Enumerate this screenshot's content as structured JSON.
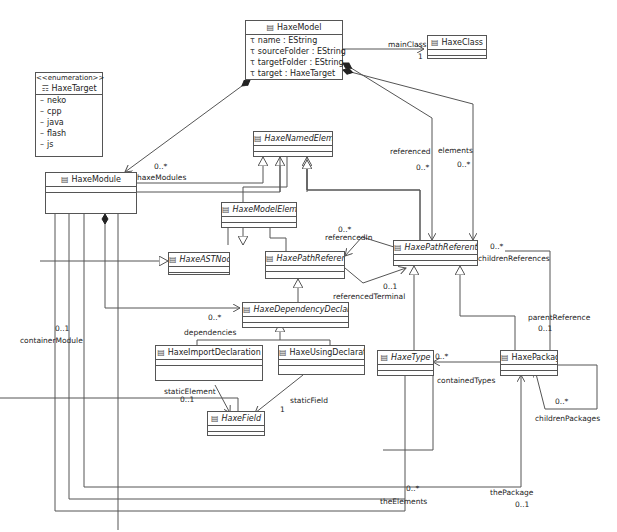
{
  "diagram": {
    "type": "UML class diagram (Ecore)",
    "classes": {
      "haxeModel": {
        "name": "HaxeModel",
        "abstract": false,
        "attributes": [
          "name : EString",
          "sourceFolder : EString",
          "targetFolder : EString",
          "target : HaxeTarget"
        ]
      },
      "haxeClass": {
        "name": "HaxeClass",
        "abstract": false
      },
      "haxeTarget": {
        "stereotype": "<<enumeration>>",
        "name": "HaxeTarget",
        "literals": [
          "neko",
          "cpp",
          "java",
          "flash",
          "js"
        ]
      },
      "haxeModule": {
        "name": "HaxeModule",
        "abstract": false
      },
      "haxeNamedElement": {
        "name": "HaxeNamedElement",
        "abstract": true
      },
      "haxeModelElement": {
        "name": "HaxeModelElement",
        "abstract": true
      },
      "haxeASTNode": {
        "name": "HaxeASTNode",
        "abstract": true
      },
      "haxePathReference": {
        "name": "HaxePathReference",
        "abstract": true
      },
      "haxePathReferentiable": {
        "name": "HaxePathReferentiable",
        "abstract": true
      },
      "haxeDependencyDeclaration": {
        "name": "HaxeDependencyDeclaration",
        "abstract": true
      },
      "haxeImportDeclaration": {
        "name": "HaxeImportDeclaration",
        "abstract": false
      },
      "haxeUsingDeclaration": {
        "name": "HaxeUsingDeclaration",
        "abstract": false
      },
      "haxeField": {
        "name": "HaxeField",
        "abstract": true
      },
      "haxeType": {
        "name": "HaxeType",
        "abstract": true
      },
      "haxePackage": {
        "name": "HaxePackage",
        "abstract": false
      }
    },
    "labels": {
      "mainClass": "mainClass",
      "mainClassMult": "1",
      "haxeModulesMult": "0..*",
      "haxeModules": "haxeModules",
      "referenced": "referenced",
      "referencedMult": "0..*",
      "elements": "elements",
      "elementsMult": "0..*",
      "referencedInMult": "0..*",
      "referencedIn": "referencedIn",
      "childrenReferencesMult": "0..*",
      "childrenReferences": "childrenReferences",
      "referencedTerminalMult": "0..1",
      "referencedTerminal": "referencedTerminal",
      "dependenciesMult": "0..*",
      "dependencies": "dependencies",
      "parentReference": "parentReference",
      "parentReferenceMult": "0..1",
      "containerModuleMult": "0..1",
      "containerModule": "containerModule",
      "containedTypesMult": "0..*",
      "containedTypes": "containedTypes",
      "staticElement": "staticElement",
      "staticElementMult": "0..1",
      "staticField": "staticField",
      "staticFieldMult": "1",
      "childrenPackagesMult": "0..*",
      "childrenPackages": "childrenPackages",
      "theElementsMult": "0..*",
      "theElements": "theElements",
      "thePackage": "thePackage",
      "thePackageMult": "0..1"
    }
  }
}
